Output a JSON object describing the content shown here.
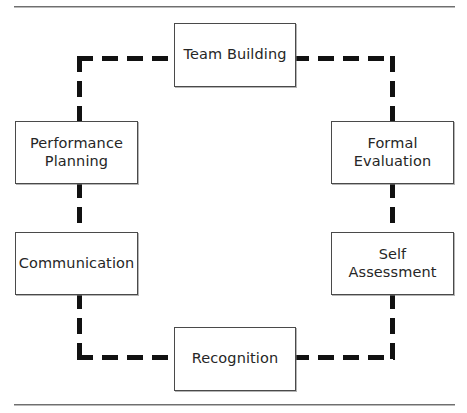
{
  "figure": {
    "width": 467,
    "height": 413,
    "background_color": "#ffffff",
    "rule_color": "#8e8e8e",
    "box_border_color": "#4a4a4a",
    "text_color": "#262626",
    "connector_color": "#111111",
    "connector_style": "dashed"
  },
  "diagram": {
    "type": "cycle",
    "direction": "clockwise",
    "nodes": [
      {
        "id": "team-building",
        "label": "Team Building",
        "position": "top"
      },
      {
        "id": "formal-evaluation",
        "label": "Formal\nEvaluation",
        "position": "right-upper"
      },
      {
        "id": "self-assessment",
        "label": "Self\nAssessment",
        "position": "right-lower"
      },
      {
        "id": "recognition",
        "label": "Recognition",
        "position": "bottom"
      },
      {
        "id": "communication",
        "label": "Communication",
        "position": "left-lower"
      },
      {
        "id": "performance-planning",
        "label": "Performance\nPlanning",
        "position": "left-upper"
      }
    ]
  }
}
